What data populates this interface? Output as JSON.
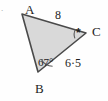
{
  "figure": {
    "type": "geometry-triangle-diagram",
    "corner_mark": ".",
    "background_color": "#fefefe",
    "fill_color": "#d9d9d9",
    "stroke_color": "#4a4a4a",
    "text_color": "#1d1d1d",
    "vertices": [
      {
        "name": "A",
        "label": "A",
        "x": 22,
        "y": 14
      },
      {
        "name": "B",
        "label": "B",
        "x": 38,
        "y": 72
      },
      {
        "name": "C",
        "label": "C",
        "x": 86,
        "y": 33
      }
    ],
    "sides": [
      {
        "name": "AC",
        "label": "8",
        "from": "A",
        "to": "C"
      },
      {
        "name": "BC",
        "label": "6·5",
        "from": "B",
        "to": "C"
      },
      {
        "name": "AB",
        "label": "",
        "from": "A",
        "to": "B"
      }
    ],
    "angles": [
      {
        "at": "B",
        "label": "67°",
        "marked": true,
        "mark_type": "arc"
      },
      {
        "at": "C",
        "label": "*",
        "marked": true,
        "mark_type": "asterisk"
      },
      {
        "at": "A",
        "label": "",
        "marked": false,
        "mark_type": "none"
      }
    ]
  }
}
